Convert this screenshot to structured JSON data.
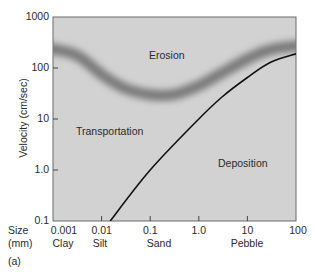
{
  "chart_data": {
    "type": "line",
    "title": "",
    "subtitle": "",
    "panel_label": "(a)",
    "xlabel": "Size (mm)",
    "xlabel_lines": [
      "Size",
      "(mm)"
    ],
    "ylabel": "Velocity (cm/sec)",
    "xscale": "log",
    "yscale": "log",
    "xlim": [
      0.001,
      100
    ],
    "ylim": [
      0.1,
      1000
    ],
    "grid": false,
    "legend": null,
    "x_ticks": [
      "0.001",
      "0.01",
      "0.1",
      "1.0",
      "10",
      "100"
    ],
    "y_ticks": [
      "0.1",
      "1.0",
      "10",
      "100",
      "1000"
    ],
    "size_classes": [
      "Clay",
      "Silt",
      "Sand",
      "Pebble"
    ],
    "regions": [
      "Erosion",
      "Transportation",
      "Deposition"
    ],
    "series": [
      {
        "name": "Erosion threshold (shaded band)",
        "style": "blurred band",
        "x": [
          0.001,
          0.003,
          0.01,
          0.03,
          0.1,
          0.3,
          1.0,
          3.0,
          10,
          30,
          100
        ],
        "y": [
          250,
          180,
          75,
          40,
          30,
          30,
          45,
          80,
          150,
          230,
          280
        ]
      },
      {
        "name": "Deposition threshold (line)",
        "style": "solid line",
        "x": [
          0.015,
          0.1,
          1.0,
          3.0,
          10,
          30,
          100
        ],
        "y": [
          0.1,
          1.0,
          10,
          27,
          65,
          130,
          190
        ]
      }
    ]
  }
}
